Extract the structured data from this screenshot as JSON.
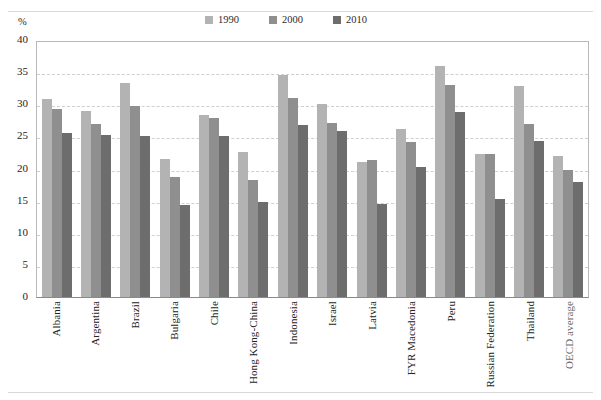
{
  "figure": {
    "title_cut": "",
    "y_unit": "%"
  },
  "legend": {
    "position": "top-center",
    "items": [
      {
        "label": "1990",
        "color": "#b3b3b3"
      },
      {
        "label": "2000",
        "color": "#8f8f8f"
      },
      {
        "label": "2010",
        "color": "#6d6d6d"
      }
    ]
  },
  "axis": {
    "y_ticks": [
      "40",
      "35",
      "30",
      "25",
      "20",
      "15",
      "10",
      "5",
      "0"
    ]
  },
  "chart_data": {
    "type": "bar",
    "title": "",
    "xlabel": "",
    "ylabel": "%",
    "ylim": [
      0,
      40
    ],
    "ytick_step": 5,
    "grid": true,
    "legend_position": "top-center",
    "categories": [
      "Albania",
      "Argentina",
      "Brazil",
      "Bulgaria",
      "Chile",
      "Hong Kong-China",
      "Indonesia",
      "Israel",
      "Latvia",
      "FYR Macedonia",
      "Peru",
      "Russian Federation",
      "Thailand",
      "OECD average"
    ],
    "series": [
      {
        "name": "1990",
        "color": "#b3b3b3",
        "values": [
          30.8,
          28.9,
          33.3,
          21.5,
          28.4,
          22.5,
          34.5,
          30.0,
          21.0,
          26.2,
          36.0,
          22.2,
          32.8,
          22.0
        ]
      },
      {
        "name": "2000",
        "color": "#8f8f8f",
        "values": [
          29.3,
          27.0,
          29.8,
          18.7,
          27.8,
          18.2,
          30.9,
          27.1,
          21.3,
          24.1,
          33.0,
          22.2,
          27.0,
          19.8
        ]
      },
      {
        "name": "2010",
        "color": "#6d6d6d",
        "values": [
          25.6,
          25.2,
          25.0,
          14.3,
          25.0,
          14.8,
          26.8,
          25.8,
          14.4,
          20.3,
          28.8,
          15.3,
          24.3,
          17.9
        ]
      }
    ]
  }
}
